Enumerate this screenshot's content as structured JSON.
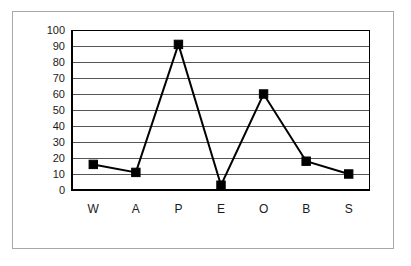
{
  "chart_data": {
    "type": "line",
    "title": "",
    "subtitle": "",
    "xlabel": "",
    "ylabel": "",
    "categories": [
      "W",
      "A",
      "P",
      "E",
      "O",
      "B",
      "S"
    ],
    "values": [
      16,
      11,
      91,
      3,
      60,
      18,
      10
    ],
    "series": [
      {
        "name": "",
        "values": [
          16,
          11,
          91,
          3,
          60,
          18,
          10
        ]
      }
    ],
    "ylim": [
      0,
      100
    ],
    "ytick_labels": [
      "100",
      "90",
      "80",
      "70",
      "60",
      "50",
      "40",
      "30",
      "20",
      "10",
      "0"
    ],
    "ytick_values": [
      100,
      90,
      80,
      70,
      60,
      50,
      40,
      30,
      20,
      10,
      0
    ],
    "ytick_step": 10,
    "grid": true,
    "grid_axis": "y",
    "legend": false,
    "legend_position": "none",
    "marker": "square",
    "marker_color": "#000000",
    "line_color": "#000000",
    "plot_background": "#ffffff",
    "annotations": []
  },
  "figure": {
    "frame_color": "#a8a8a8",
    "background": "#ffffff"
  }
}
